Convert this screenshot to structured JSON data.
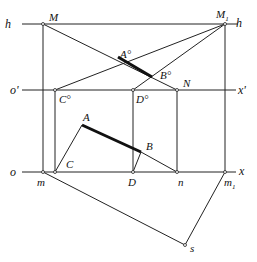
{
  "labels": {
    "h_left": "h",
    "h_right": "h",
    "o_prime": "o'",
    "x_prime": "x'",
    "o": "o",
    "x": "x",
    "M": "M",
    "M1": "M",
    "M1_sub": "1",
    "A_deg": "A°",
    "B_deg": "B°",
    "C_deg": "C°",
    "D_deg": "D°",
    "N": "N",
    "A": "A",
    "B": "B",
    "C": "C",
    "D": "D",
    "m": "m",
    "n": "n",
    "m1": "m",
    "m1_sub": "1",
    "s": "s"
  },
  "points": {
    "M": [
      43,
      24
    ],
    "M1": [
      225,
      24
    ],
    "C_deg": [
      55,
      90
    ],
    "D_deg": [
      133,
      90
    ],
    "N": [
      177,
      90
    ],
    "A_deg": [
      118,
      57
    ],
    "B_deg": [
      152,
      77
    ],
    "A": [
      82,
      125
    ],
    "B": [
      141,
      152
    ],
    "m": [
      43,
      172
    ],
    "C": [
      55,
      172
    ],
    "D": [
      133,
      172
    ],
    "n": [
      177,
      172
    ],
    "m1": [
      225,
      172
    ],
    "s": [
      185,
      245
    ]
  },
  "colors": {
    "line": "#222222",
    "background": "#ffffff"
  }
}
